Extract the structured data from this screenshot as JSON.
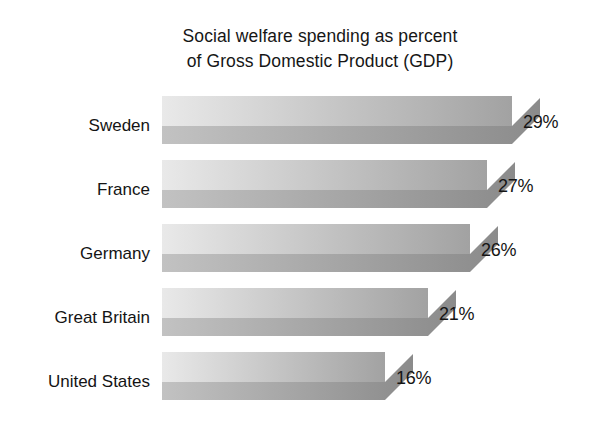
{
  "chart_data": {
    "type": "bar",
    "orientation": "horizontal",
    "title": "Social welfare spending as percent of Gross Domestic Product (GDP)",
    "title_lines": [
      "Social welfare spending as percent",
      "of Gross Domestic Product (GDP)"
    ],
    "categories": [
      "Sweden",
      "France",
      "Germany",
      "Great Britain",
      "United States"
    ],
    "values": [
      29,
      27,
      26,
      21,
      16
    ],
    "value_labels": [
      "29%",
      "27%",
      "26%",
      "21%",
      "16%"
    ],
    "unit": "%",
    "xlabel": "",
    "ylabel": "",
    "xlim": [
      0,
      33
    ],
    "grid": false,
    "legend": false,
    "style": "3d-shaded-grayscale",
    "colors": {
      "background": "#ffffff",
      "bar_face_light": "#e9e9e9",
      "bar_face_dark": "#a2a2a2",
      "bar_edge_light": "#c2c2c2",
      "bar_edge_dark": "#8b8b8b",
      "text": "#151515"
    }
  },
  "bars": [
    {
      "category": "Sweden",
      "value": 29,
      "value_label": "29%",
      "label_top": 20,
      "row_top": 0,
      "face_height": 30,
      "edge_height": 18,
      "bar_width": 350,
      "bevel": 28,
      "value_left": 523,
      "value_top": 16
    },
    {
      "category": "France",
      "value": 27,
      "value_label": "27%",
      "label_top": 84,
      "row_top": 64,
      "face_height": 30,
      "edge_height": 18,
      "bar_width": 325,
      "bevel": 28,
      "value_left": 498,
      "value_top": 80
    },
    {
      "category": "Germany",
      "value": 26,
      "value_label": "26%",
      "label_top": 148,
      "row_top": 128,
      "face_height": 30,
      "edge_height": 18,
      "bar_width": 308,
      "bevel": 28,
      "value_left": 481,
      "value_top": 144
    },
    {
      "category": "Great Britain",
      "value": 21,
      "value_label": "21%",
      "label_top": 212,
      "row_top": 192,
      "face_height": 30,
      "edge_height": 18,
      "bar_width": 266,
      "bevel": 28,
      "value_left": 439,
      "value_top": 208
    },
    {
      "category": "United States",
      "value": 16,
      "value_label": "16%",
      "label_top": 276,
      "row_top": 256,
      "face_height": 30,
      "edge_height": 18,
      "bar_width": 223,
      "bevel": 28,
      "value_left": 396,
      "value_top": 272
    }
  ]
}
